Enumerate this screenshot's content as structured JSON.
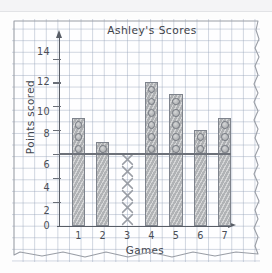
{
  "chart_data": {
    "type": "bar",
    "title": "Ashley's Scores",
    "xlabel": "Games",
    "ylabel": "Points scored",
    "categories": [
      "1",
      "2",
      "3",
      "4",
      "5",
      "6",
      "7"
    ],
    "values": [
      9,
      7,
      0,
      12,
      11,
      8,
      9
    ],
    "ylim": [
      0,
      15
    ],
    "yticks": [
      "0",
      "2",
      "4",
      "6",
      "8",
      "10",
      "12",
      "14"
    ],
    "ytick_values": [
      0,
      2,
      4,
      6,
      8,
      10,
      12,
      14
    ],
    "grid": true,
    "legend": "none",
    "reference_line": 6,
    "annotations": [
      {
        "category": "3",
        "marker": "x-stack",
        "count": 6,
        "note": "Game 3 has a value of 0; column marked with X symbols up to 6"
      }
    ],
    "marker_note": "Portions of each bar above the reference line of 6 are marked with stacked circles, one per point",
    "circles_above_reference": [
      3,
      1,
      0,
      6,
      5,
      2,
      3
    ]
  },
  "colors": {
    "bar_fill": "#b9bbbd",
    "bar_border": "#7e838c",
    "grid_line": "#96a3b9",
    "axis": "#585d66",
    "text": "#43474e",
    "paper": "#fefeff"
  },
  "bars": [
    {
      "label": "1",
      "value": 9,
      "above": 3
    },
    {
      "label": "2",
      "value": 7,
      "above": 1
    },
    {
      "label": "3",
      "value": 0,
      "above": 0
    },
    {
      "label": "4",
      "value": 12,
      "above": 6
    },
    {
      "label": "5",
      "value": 11,
      "above": 5
    },
    {
      "label": "6",
      "value": 8,
      "above": 2
    },
    {
      "label": "7",
      "value": 9,
      "above": 3
    }
  ]
}
